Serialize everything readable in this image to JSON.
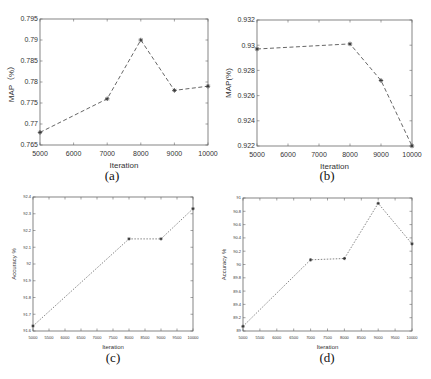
{
  "chart_data": [
    {
      "id": "a",
      "type": "line",
      "caption": "(a)",
      "title": "",
      "xlabel": "Iteration",
      "ylabel": "MAP（%）",
      "x": [
        5000,
        7000,
        8000,
        9000,
        10000
      ],
      "series": [
        {
          "name": "MAP",
          "values": [
            0.768,
            0.776,
            0.79,
            0.778,
            0.779
          ]
        }
      ],
      "xticks": [
        "5000",
        "6000",
        "7000",
        "8000",
        "9000",
        "10000"
      ],
      "xlim": [
        5000,
        10000
      ],
      "yticks": [
        "0.765",
        "0.77",
        "0.775",
        "0.78",
        "0.785",
        "0.79",
        "0.795"
      ],
      "ylim": [
        0.765,
        0.795
      ],
      "grid": false,
      "legend": null,
      "line_style": "dashed",
      "marker": "*",
      "line_color": "#555555"
    },
    {
      "id": "b",
      "type": "line",
      "caption": "(b)",
      "title": "",
      "xlabel": "Iteration",
      "ylabel": "MAP(%)",
      "x": [
        5000,
        8000,
        9000,
        10000
      ],
      "series": [
        {
          "name": "MAP",
          "values": [
            0.9297,
            0.9301,
            0.9272,
            0.922
          ]
        }
      ],
      "xticks": [
        "5000",
        "6000",
        "7000",
        "8000",
        "9000",
        "10000"
      ],
      "xlim": [
        5000,
        10000
      ],
      "yticks": [
        "0.922",
        "0.924",
        "0.926",
        "0.928",
        "0.93",
        "0.932"
      ],
      "ylim": [
        0.922,
        0.932
      ],
      "grid": false,
      "legend": null,
      "line_style": "dashed",
      "marker": "*",
      "line_color": "#555555"
    },
    {
      "id": "c",
      "type": "line",
      "caption": "(c)",
      "title": "",
      "xlabel": "Iteration",
      "ylabel": "Accuracy  %",
      "x": [
        5000,
        8000,
        9000,
        10000
      ],
      "series": [
        {
          "name": "Accuracy",
          "values": [
            91.63,
            92.15,
            92.15,
            92.33
          ]
        }
      ],
      "xticks": [
        "5000",
        "5500",
        "6000",
        "6500",
        "7000",
        "7500",
        "8000",
        "8500",
        "9000",
        "9500",
        "10000"
      ],
      "xlim": [
        5000,
        10000
      ],
      "yticks": [
        "91.6",
        "91.7",
        "91.8",
        "91.9",
        "92",
        "92.1",
        "92.2",
        "92.3",
        "92.4"
      ],
      "ylim": [
        91.6,
        92.4
      ],
      "grid": false,
      "legend": null,
      "line_style": "dotted",
      "marker": "*",
      "line_color": "#777777"
    },
    {
      "id": "d",
      "type": "line",
      "caption": "(d)",
      "title": "",
      "xlabel": "Iteration",
      "ylabel": "Accuracy  %",
      "x": [
        5000,
        7000,
        8000,
        9000,
        10000
      ],
      "series": [
        {
          "name": "Accuracy",
          "values": [
            89.07,
            90.07,
            90.09,
            90.92,
            90.31
          ]
        }
      ],
      "xticks": [
        "5000",
        "5500",
        "6000",
        "6500",
        "7000",
        "7500",
        "8000",
        "8500",
        "9000",
        "9500",
        "10000"
      ],
      "xlim": [
        5000,
        10000
      ],
      "yticks": [
        "89",
        "89.2",
        "89.4",
        "89.6",
        "89.8",
        "90",
        "90.2",
        "90.4",
        "90.6",
        "90.8",
        "91"
      ],
      "ylim": [
        89,
        91
      ],
      "grid": false,
      "legend": null,
      "line_style": "dotted",
      "marker": "*",
      "line_color": "#777777"
    }
  ]
}
